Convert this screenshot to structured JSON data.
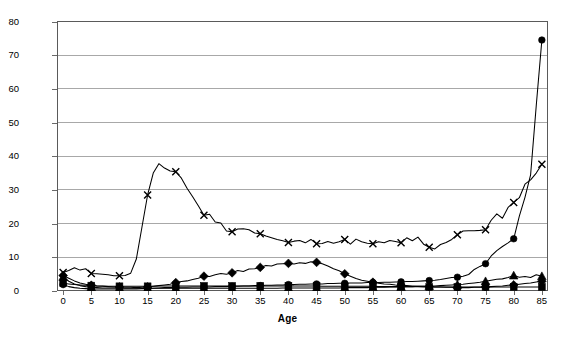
{
  "chart_data": {
    "type": "line",
    "title": "",
    "xlabel": "Age",
    "ylabel": "",
    "xlim": [
      -1,
      86
    ],
    "ylim": [
      0,
      80
    ],
    "grid": true,
    "legend": "none",
    "xticks": [
      0,
      5,
      10,
      15,
      20,
      25,
      30,
      35,
      40,
      45,
      50,
      55,
      60,
      65,
      70,
      75,
      80,
      85
    ],
    "yticks": [
      0,
      10,
      20,
      30,
      40,
      50,
      60,
      70,
      80
    ],
    "marker_interval": 5,
    "x": [
      0,
      1,
      2,
      3,
      4,
      5,
      6,
      7,
      8,
      9,
      10,
      11,
      12,
      13,
      14,
      15,
      16,
      17,
      18,
      19,
      20,
      21,
      22,
      23,
      24,
      25,
      26,
      27,
      28,
      29,
      30,
      31,
      32,
      33,
      34,
      35,
      36,
      37,
      38,
      39,
      40,
      41,
      42,
      43,
      44,
      45,
      46,
      47,
      48,
      49,
      50,
      51,
      52,
      53,
      54,
      55,
      56,
      57,
      58,
      59,
      60,
      61,
      62,
      63,
      64,
      65,
      66,
      67,
      68,
      69,
      70,
      71,
      72,
      73,
      74,
      75,
      76,
      77,
      78,
      79,
      80,
      81,
      82,
      83,
      84,
      85
    ],
    "series": [
      {
        "name": "series-x",
        "marker": "x",
        "values": [
          5.5,
          6.1,
          6.9,
          6.2,
          6.6,
          5.2,
          5.1,
          5.0,
          4.8,
          4.5,
          4.5,
          4.6,
          5.3,
          9.5,
          19.0,
          28.5,
          35.0,
          37.8,
          36.5,
          35.6,
          35.4,
          33.5,
          30.5,
          28.0,
          25.3,
          22.5,
          22.8,
          20.5,
          20.2,
          17.8,
          17.6,
          18.4,
          18.5,
          18.2,
          17.2,
          17.0,
          16.3,
          15.8,
          15.3,
          14.9,
          14.4,
          14.8,
          15.0,
          14.3,
          15.3,
          14.0,
          14.1,
          14.7,
          14.2,
          14.6,
          15.3,
          13.9,
          15.4,
          14.6,
          14.2,
          14.0,
          14.6,
          14.3,
          15.0,
          14.7,
          14.3,
          15.8,
          14.9,
          16.0,
          13.9,
          13.0,
          12.5,
          13.8,
          14.4,
          15.3,
          16.7,
          17.8,
          17.9,
          17.9,
          18.0,
          18.2,
          21.0,
          22.9,
          21.6,
          24.8,
          26.3,
          27.7,
          31.7,
          33.0,
          35.0,
          37.6
        ]
      },
      {
        "name": "series-circle",
        "marker": "circle",
        "values": [
          1.9,
          1.3,
          1.0,
          0.8,
          0.7,
          0.6,
          0.6,
          0.6,
          0.6,
          0.6,
          0.6,
          0.6,
          0.6,
          0.6,
          0.7,
          0.7,
          0.8,
          0.9,
          1.0,
          1.0,
          1.1,
          1.1,
          1.1,
          1.2,
          1.2,
          1.2,
          1.2,
          1.3,
          1.3,
          1.3,
          1.4,
          1.4,
          1.5,
          1.5,
          1.6,
          1.6,
          1.7,
          1.7,
          1.8,
          1.8,
          1.9,
          1.9,
          2.0,
          2.0,
          2.1,
          2.1,
          2.1,
          2.2,
          2.2,
          2.3,
          2.3,
          2.4,
          2.4,
          2.4,
          2.5,
          2.5,
          2.5,
          2.6,
          2.6,
          2.7,
          2.7,
          2.8,
          2.8,
          2.9,
          3.0,
          3.1,
          3.2,
          3.4,
          3.7,
          4.0,
          4.1,
          4.4,
          4.9,
          6.4,
          7.3,
          8.1,
          10.4,
          12.0,
          13.2,
          14.3,
          15.5,
          22.2,
          27.8,
          34.5,
          55.0,
          74.5
        ]
      },
      {
        "name": "series-diamond",
        "marker": "diamond",
        "values": [
          4.6,
          3.8,
          3.0,
          2.4,
          2.0,
          1.7,
          1.5,
          1.4,
          1.3,
          1.2,
          1.2,
          1.1,
          1.1,
          1.0,
          1.1,
          1.2,
          1.4,
          1.6,
          1.8,
          2.0,
          2.5,
          2.8,
          3.0,
          3.4,
          3.8,
          4.4,
          4.3,
          4.8,
          5.2,
          5.0,
          5.4,
          6.1,
          5.8,
          6.5,
          6.6,
          7.0,
          7.6,
          7.4,
          8.0,
          8.1,
          8.2,
          8.0,
          8.4,
          8.2,
          8.7,
          8.5,
          8.1,
          7.4,
          6.6,
          6.0,
          5.1,
          4.4,
          3.7,
          3.2,
          2.9,
          2.6,
          2.3,
          2.1,
          2.0,
          1.8,
          1.7,
          1.6,
          1.5,
          1.4,
          1.4,
          1.3,
          1.2,
          1.2,
          1.1,
          1.1,
          1.0,
          1.0,
          1.0,
          1.1,
          1.1,
          1.2,
          1.3,
          1.4,
          1.5,
          1.7,
          1.8,
          2.0,
          2.2,
          2.4,
          2.7,
          2.9
        ]
      },
      {
        "name": "series-square",
        "marker": "square",
        "values": [
          2.3,
          2.1,
          1.9,
          1.8,
          1.7,
          1.6,
          1.5,
          1.5,
          1.4,
          1.4,
          1.4,
          1.4,
          1.4,
          1.4,
          1.4,
          1.4,
          1.4,
          1.5,
          1.5,
          1.5,
          1.5,
          1.5,
          1.5,
          1.5,
          1.5,
          1.5,
          1.5,
          1.5,
          1.5,
          1.5,
          1.5,
          1.5,
          1.5,
          1.5,
          1.5,
          1.5,
          1.5,
          1.5,
          1.5,
          1.5,
          1.5,
          1.5,
          1.5,
          1.5,
          1.5,
          1.5,
          1.4,
          1.4,
          1.4,
          1.4,
          1.4,
          1.4,
          1.4,
          1.4,
          1.4,
          1.4,
          1.3,
          1.3,
          1.3,
          1.3,
          1.3,
          1.3,
          1.3,
          1.3,
          1.2,
          1.2,
          1.2,
          1.2,
          1.2,
          1.2,
          1.2,
          1.2,
          1.2,
          1.2,
          1.2,
          1.2,
          1.2,
          1.2,
          1.2,
          1.2,
          1.2,
          1.2,
          1.2,
          1.2,
          1.2,
          1.2
        ]
      },
      {
        "name": "series-triangle",
        "marker": "triangle",
        "values": [
          4.2,
          2.9,
          2.1,
          1.6,
          1.3,
          1.1,
          1.0,
          0.9,
          0.9,
          0.9,
          0.9,
          0.8,
          0.8,
          0.8,
          0.8,
          0.8,
          0.8,
          0.8,
          0.8,
          0.8,
          0.8,
          0.8,
          0.8,
          0.8,
          0.8,
          0.8,
          0.8,
          0.8,
          0.8,
          0.8,
          0.8,
          0.8,
          0.8,
          0.8,
          0.8,
          0.8,
          0.8,
          0.8,
          0.8,
          0.9,
          0.9,
          0.9,
          0.9,
          0.9,
          0.9,
          0.9,
          0.9,
          0.9,
          0.9,
          0.9,
          1.0,
          1.0,
          1.0,
          1.0,
          1.0,
          1.1,
          1.1,
          1.1,
          1.2,
          1.2,
          1.2,
          1.3,
          1.3,
          1.4,
          1.4,
          1.5,
          1.5,
          1.6,
          1.7,
          1.8,
          1.9,
          2.0,
          2.2,
          2.4,
          2.6,
          2.9,
          3.2,
          3.5,
          3.6,
          4.0,
          4.6,
          4.1,
          4.3,
          4.0,
          4.8,
          4.4
        ]
      }
    ]
  }
}
